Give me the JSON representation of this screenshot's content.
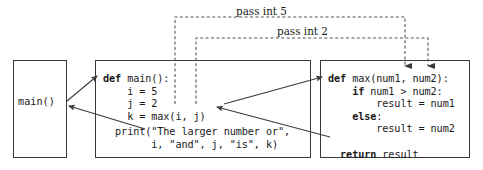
{
  "diagram": {
    "caller_box": {
      "label": "main()"
    },
    "main_def_box": {
      "code_lines": [
        "def main():",
        "    i = 5",
        "    j = 2",
        "    k = max(i, j)"
      ],
      "code_block": "def main():\n    i = 5\n    j = 2\n    k = max(i, j)",
      "print_block": "  print(\"The larger number or\",\n        i, \"and\", j, \"is\", k)",
      "keywords": [
        "def"
      ]
    },
    "max_def_box": {
      "code_lines": [
        "def max(num1, num2):",
        "    if num1 > num2:",
        "        result = num1",
        "    else:",
        "        result = num2",
        "",
        "    return result"
      ],
      "code_block": "def max(num1, num2):\n    if num1 > num2:\n        result = num1\n    else:\n        result = num2\n\n  return result",
      "keywords": [
        "def",
        "if",
        "else",
        "return"
      ]
    },
    "annotations": {
      "pass_int_5": "pass int 5",
      "pass_int_2": "pass int 2"
    },
    "colors": {
      "line": "#3a3a3a",
      "dashed_line": "#555555",
      "text": "#1a1a1a",
      "background": "#ffffff"
    }
  }
}
